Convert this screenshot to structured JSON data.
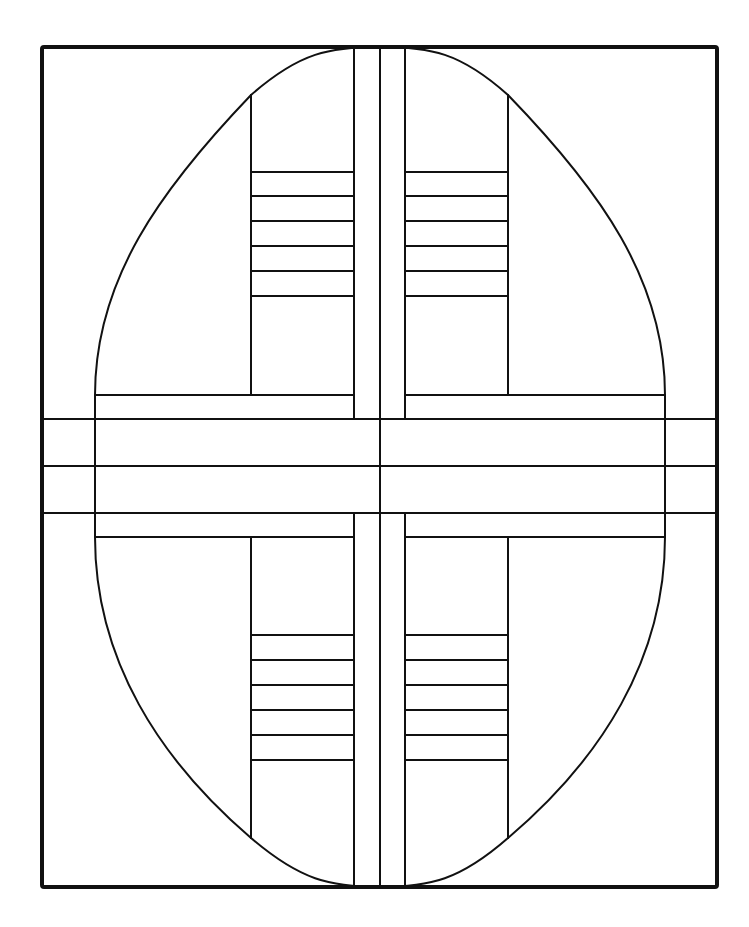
{
  "artwork": {
    "type": "coloring-page",
    "description": "Geometric oval with cross bars and ladder rungs",
    "colors": {
      "line": "#111111",
      "background": "#ffffff"
    },
    "frame": {
      "x": 42,
      "y": 47,
      "width": 675,
      "height": 840
    },
    "oval": {
      "cx": 380,
      "top": 47,
      "bottom": 887,
      "left": 95,
      "right": 665
    },
    "vertical_band_x": [
      354,
      380,
      405
    ],
    "horizontal_band_y": [
      419,
      466,
      513
    ],
    "inner_bar_y": {
      "top": 395,
      "bottom": 537
    },
    "ladder_x": {
      "left": 251,
      "right": 508
    },
    "top_rungs_y": [
      172,
      196,
      221,
      246,
      271,
      296
    ],
    "bottom_rungs_y": [
      635,
      660,
      685,
      710,
      735,
      760
    ]
  }
}
